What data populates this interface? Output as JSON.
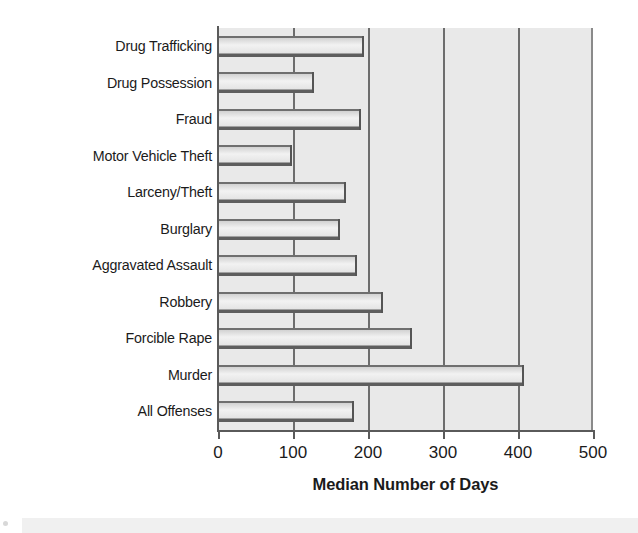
{
  "chart_data": {
    "type": "bar",
    "orientation": "horizontal",
    "title": "",
    "xlabel": "Median Number of Days",
    "ylabel": "",
    "xlim": [
      0,
      500
    ],
    "xticks": [
      0,
      100,
      200,
      300,
      400,
      500
    ],
    "xtick_labels": [
      "0",
      "100",
      "200",
      "300",
      "400",
      "500"
    ],
    "grid": "vertical",
    "legend": "none",
    "categories": [
      "Drug Trafficking",
      "Drug Possession",
      "Fraud",
      "Motor Vehicle Theft",
      "Larceny/Theft",
      "Burglary",
      "Aggravated Assault",
      "Robbery",
      "Forcible Rape",
      "Murder",
      "All Offenses"
    ],
    "values": [
      195,
      128,
      190,
      98,
      170,
      162,
      185,
      220,
      258,
      408,
      181
    ],
    "series": [
      {
        "name": "Median Number of Days",
        "values": [
          195,
          128,
          190,
          98,
          170,
          162,
          185,
          220,
          258,
          408,
          181
        ]
      }
    ],
    "colors": {
      "plot_background": "#e9e9e9",
      "bar_fill": "#f0f0f0",
      "bar_edge": "#5e5e5e",
      "gridline": "#6d6d6d",
      "axis": "#5a5a5a",
      "text": "#1b1b1b",
      "page_background": "#ffffff"
    }
  }
}
